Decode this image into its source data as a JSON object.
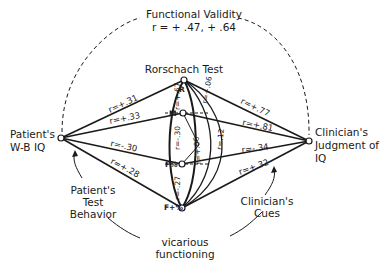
{
  "title": {
    "label": "Functional Validity",
    "values": "r = + .47, + .64"
  },
  "nodes": {
    "patient": {
      "line1": "Patient's",
      "line2": "W-B IQ"
    },
    "clinician": {
      "line1": "Clinician's",
      "line2": "Judgment of",
      "line3": "IQ"
    },
    "rorschach": {
      "label": "Rorschach Test"
    },
    "cues": {
      "R": "R",
      "M": "M",
      "Fpct": "F%",
      "Fplus": "F+%"
    }
  },
  "left_correlations": [
    {
      "cue": "R",
      "label": "r=+.31"
    },
    {
      "cue": "M",
      "label": "r=+.33"
    },
    {
      "cue": "F%",
      "label": "r=-.30"
    },
    {
      "cue": "F+%",
      "label": "r=+.28"
    }
  ],
  "right_correlations": [
    {
      "cue": "R",
      "label": "r=+.77"
    },
    {
      "cue": "M",
      "label": "r=+.81"
    },
    {
      "cue": "F%",
      "label": "r=-.34"
    },
    {
      "cue": "F+%",
      "label": "r=+.32"
    }
  ],
  "intercorrelations": [
    {
      "pair": "R-M",
      "label": "r=+.67"
    },
    {
      "pair": "M-F%",
      "label": "r=-.30"
    },
    {
      "pair": "F%-F+%",
      "label": "r=-.27"
    },
    {
      "pair": "R-F%",
      "label": "r=+.06"
    },
    {
      "pair": "M-F+%",
      "label": "r=+.06"
    },
    {
      "pair": "R-F+%",
      "label": "r=.12"
    }
  ],
  "annotations": {
    "patient_behavior": {
      "line1": "Patient's",
      "line2": "Test",
      "line3": "Behavior"
    },
    "clinician_cues": {
      "line1": "Clinician's",
      "line2": "Cues"
    },
    "vicarious": {
      "line1": "vicarious",
      "line2": "functioning"
    }
  },
  "colors": {
    "ink": "#1a1a1a",
    "background": "#ffffff"
  }
}
